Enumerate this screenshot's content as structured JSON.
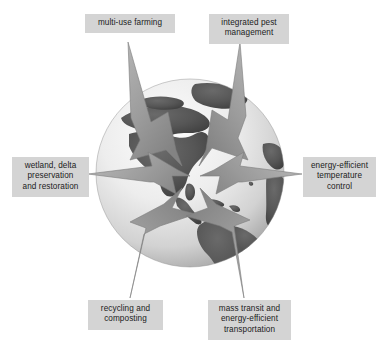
{
  "figure": {
    "center_graphic": "earth-globe-western-hemisphere",
    "background_color": "#ffffff"
  },
  "globe": {
    "name": "earth-globe",
    "ocean_color": "#e9e9e9",
    "land_color": "#5a5a5a",
    "shadow_color": "#b7b7b7",
    "highlight_color": "#f4f4f4",
    "center_x": 190,
    "center_y": 173,
    "radius": 95
  },
  "arrows": {
    "fill_color": "#9a9a9a",
    "edge_color": "#7e7e7e",
    "count": 6,
    "direction": "inward"
  },
  "labels": {
    "box_color": "#d4d4d4",
    "text_color": "#1b1b1b",
    "items": [
      {
        "id": "multi-use-farming",
        "text": "multi-use farming",
        "position": "top-left"
      },
      {
        "id": "integrated-pest-management",
        "text": "integrated pest\nmanagement",
        "position": "top-right"
      },
      {
        "id": "wetland-delta-preservation",
        "text": "wetland, delta\npreservation\nand restoration",
        "position": "left"
      },
      {
        "id": "energy-efficient-temperature-control",
        "text": "energy-efficient\ntemperature\ncontrol",
        "position": "right"
      },
      {
        "id": "recycling-and-composting",
        "text": "recycling and\ncomposting",
        "position": "bottom-left"
      },
      {
        "id": "mass-transit-energy-efficient-transportation",
        "text": "mass transit and\nenergy-efficient\ntransportation",
        "position": "bottom-right"
      }
    ]
  }
}
